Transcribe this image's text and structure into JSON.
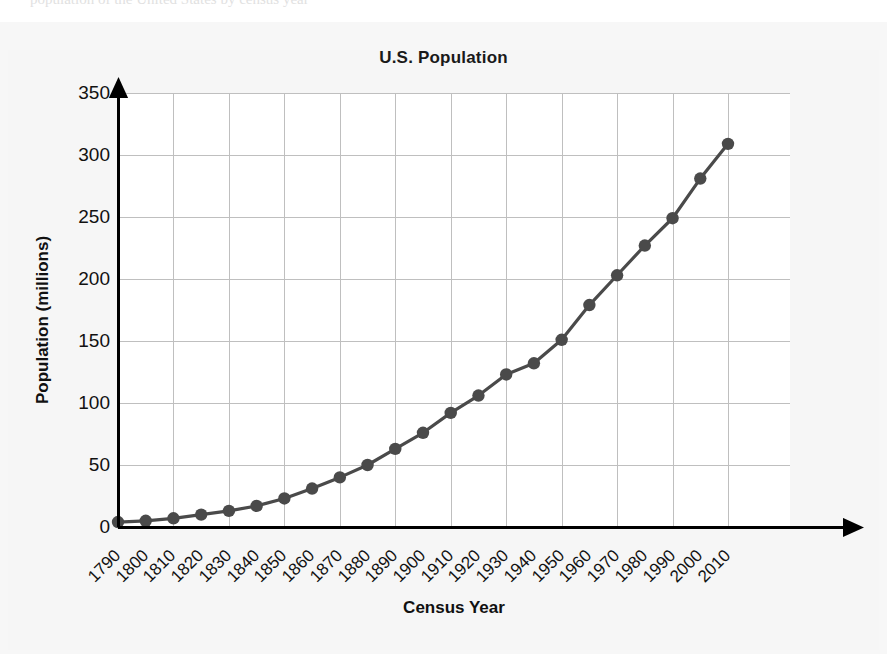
{
  "scan": {
    "top_cut_text": "population of the United States by census year"
  },
  "chart_data": {
    "type": "line",
    "title": "U.S. Population",
    "xlabel": "Census Year",
    "ylabel": "Population (millions)",
    "categories": [
      "1790",
      "1800",
      "1810",
      "1820",
      "1830",
      "1840",
      "1850",
      "1860",
      "1870",
      "1880",
      "1890",
      "1900",
      "1910",
      "1920",
      "1930",
      "1940",
      "1950",
      "1960",
      "1970",
      "1980",
      "1990",
      "2000",
      "2010"
    ],
    "values": [
      4,
      5,
      7,
      10,
      13,
      17,
      23,
      31,
      40,
      50,
      63,
      76,
      92,
      106,
      123,
      132,
      151,
      179,
      203,
      227,
      249,
      281,
      309
    ],
    "series": [
      {
        "name": "U.S. Population",
        "values": [
          4,
          5,
          7,
          10,
          13,
          17,
          23,
          31,
          40,
          50,
          63,
          76,
          92,
          106,
          123,
          132,
          151,
          179,
          203,
          227,
          249,
          281,
          309
        ]
      }
    ],
    "xlim": [
      1790,
      2010
    ],
    "ylim": [
      0,
      350
    ],
    "ytick_labels": [
      "0",
      "50",
      "100",
      "150",
      "200",
      "250",
      "300",
      "350"
    ],
    "ytick_values": [
      0,
      50,
      100,
      150,
      200,
      250,
      300,
      350
    ],
    "xgrid_years": [
      1790,
      1810,
      1830,
      1850,
      1870,
      1890,
      1910,
      1930,
      1950,
      1970,
      1990,
      2010
    ],
    "grid": true,
    "legend": "none",
    "marker": "circle",
    "series_color": "#4a4a4a",
    "grid_color": "#bfbfbf",
    "axis_color": "#000000",
    "plot_background": "#ffffff",
    "figure_background": "#f6f6f6"
  }
}
